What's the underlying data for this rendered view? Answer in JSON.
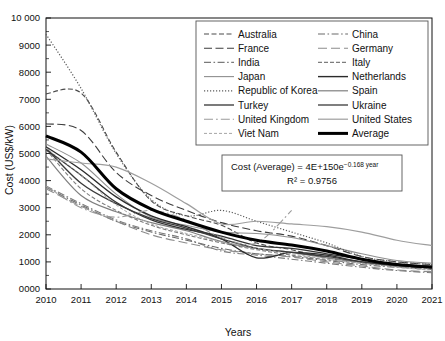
{
  "chart_data": {
    "type": "line",
    "title": "",
    "xlabel": "Years",
    "ylabel": "Cost (US$/kW)",
    "xlim": [
      2010,
      2021
    ],
    "ylim": [
      0,
      10000
    ],
    "grid": false,
    "legend_position": "top-right-inside",
    "x_tick_labels": [
      "2010",
      "2011",
      "2012",
      "2013",
      "2014",
      "2015",
      "2016",
      "2017",
      "2018",
      "2019",
      "2020",
      "2021"
    ],
    "y_tick_labels": [
      "0000",
      "1000",
      "2000",
      "3000",
      "4000",
      "5000",
      "6000",
      "7000",
      "8000",
      "9000",
      "10 000"
    ],
    "y_tick_values": [
      0,
      1000,
      2000,
      3000,
      4000,
      5000,
      6000,
      7000,
      8000,
      9000,
      10000
    ],
    "x": [
      2010,
      2011,
      2012,
      2013,
      2014,
      2015,
      2016,
      2017,
      2018,
      2019,
      2020,
      2021
    ],
    "annotations": [
      {
        "name": "equation-box",
        "line1": "Cost (Average) = 4E+150e",
        "exponent": "−0.168 year",
        "line2": "R² = 0.9756"
      }
    ],
    "series": [
      {
        "name": "Australia",
        "style": "dashed",
        "color": "#4a4a4a",
        "width": 1.1,
        "values": [
          7200,
          7230,
          5050,
          3250,
          2700,
          2350,
          1700,
          1450,
          1150,
          1000,
          900,
          830
        ]
      },
      {
        "name": "China",
        "style": "dash-dot",
        "color": "#6b6b6b",
        "width": 1.1,
        "values": [
          3750,
          3100,
          2500,
          2100,
          1800,
          1500,
          1300,
          1200,
          1050,
          900,
          800,
          720
        ]
      },
      {
        "name": "France",
        "style": "long-dash",
        "color": "#3d3d3d",
        "width": 1.1,
        "values": [
          6100,
          5850,
          4300,
          3450,
          2900,
          2450,
          2150,
          1950,
          1600,
          1200,
          1000,
          900
        ]
      },
      {
        "name": "Germany",
        "style": "long-dash-gray",
        "color": "#8c8c8c",
        "width": 1.1,
        "values": [
          3700,
          3050,
          2500,
          2000,
          1700,
          1450,
          1300,
          1180,
          1000,
          850,
          700,
          640
        ]
      },
      {
        "name": "India",
        "style": "dash-dot",
        "color": "#7a7a7a",
        "width": 1.1,
        "values": [
          3800,
          3150,
          2550,
          2150,
          1850,
          1400,
          1250,
          1100,
          950,
          800,
          680,
          600
        ]
      },
      {
        "name": "Italy",
        "style": "dashed-gray",
        "color": "#7d7d7d",
        "width": 1.1,
        "values": [
          5150,
          3700,
          2900,
          2350,
          2000,
          1700,
          1450,
          1250,
          1080,
          950,
          820,
          760
        ]
      },
      {
        "name": "Japan",
        "style": "solid-gray",
        "color": "#8f8f8f",
        "width": 1.1,
        "values": [
          5350,
          4650,
          3500,
          2650,
          2350,
          2100,
          2050,
          1900,
          1600,
          1300,
          1050,
          950
        ]
      },
      {
        "name": "Netherlands",
        "style": "solid-dark",
        "color": "#2b2b2b",
        "width": 1.4,
        "values": [
          5250,
          4400,
          3400,
          2700,
          2300,
          1850,
          1150,
          1350,
          1250,
          1000,
          880,
          800
        ]
      },
      {
        "name": "Republic of Korea",
        "style": "dotted",
        "color": "#5c5c5c",
        "width": 1.2,
        "values": [
          9400,
          7400,
          5000,
          3300,
          2700,
          2900,
          2500,
          2100,
          1700,
          1200,
          1000,
          900
        ]
      },
      {
        "name": "Spain",
        "style": "solid-gray2",
        "color": "#7f7f7f",
        "width": 1.2,
        "values": [
          4900,
          3450,
          2850,
          2450,
          2150,
          1750,
          1500,
          1350,
          1150,
          980,
          850,
          780
        ]
      },
      {
        "name": "Turkey",
        "style": "solid-dark2",
        "color": "#333333",
        "width": 1.3,
        "values": [
          5150,
          4200,
          3200,
          2550,
          2200,
          1950,
          1600,
          1500,
          1300,
          1100,
          920,
          850
        ]
      },
      {
        "name": "Ukraine",
        "style": "solid-dark3",
        "color": "#3a3a3a",
        "width": 1.3,
        "values": [
          5200,
          3900,
          3150,
          2600,
          2250,
          1850,
          1500,
          1350,
          1200,
          1000,
          860,
          790
        ]
      },
      {
        "name": "United Kingdom",
        "style": "dash-dot-long",
        "color": "#9a9a9a",
        "width": 1.1,
        "values": [
          3800,
          3000,
          2650,
          2900,
          2550,
          1900,
          1700,
          2900,
          null,
          null,
          null,
          null
        ]
      },
      {
        "name": "United States",
        "style": "solid-light",
        "color": "#9e9e9e",
        "width": 1.2,
        "values": [
          4800,
          4650,
          4500,
          3900,
          3150,
          2400,
          2500,
          2400,
          2300,
          2100,
          1800,
          1600
        ]
      },
      {
        "name": "Viet Nam",
        "style": "dashed-light",
        "color": "#a5a5a5",
        "width": 1.0,
        "values": [
          5200,
          4200,
          3100,
          2400,
          2050,
          1750,
          1500,
          1300,
          1100,
          950,
          800,
          700
        ]
      },
      {
        "name": "Average",
        "style": "solid-bold",
        "color": "#000000",
        "width": 3.0,
        "values": [
          5650,
          5050,
          3700,
          2950,
          2500,
          2100,
          1800,
          1620,
          1400,
          1100,
          900,
          800
        ]
      }
    ],
    "legend": {
      "columns": 2,
      "left_column": [
        "Australia",
        "France",
        "India",
        "Japan",
        "Republic of Korea",
        "Turkey",
        "United Kingdom",
        "Viet Nam"
      ],
      "right_column": [
        "China",
        "Germany",
        "Italy",
        "Netherlands",
        "Spain",
        "Ukraine",
        "United States",
        "Average"
      ]
    }
  },
  "figure": {
    "y_axis_title": "Cost (US$/kW)",
    "x_axis_title": "Years"
  }
}
